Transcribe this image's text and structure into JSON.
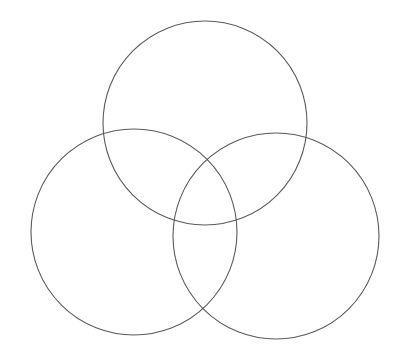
{
  "diagram": {
    "type": "venn",
    "sets": 3,
    "background": "#ffffff",
    "stroke_color": "#5a5a5a",
    "stroke_width": 1.1,
    "circles": [
      {
        "name": "top",
        "cx": 205,
        "cy": 123,
        "r": 102
      },
      {
        "name": "left",
        "cx": 134,
        "cy": 232,
        "r": 103
      },
      {
        "name": "right",
        "cx": 276,
        "cy": 236,
        "r": 103
      }
    ]
  }
}
